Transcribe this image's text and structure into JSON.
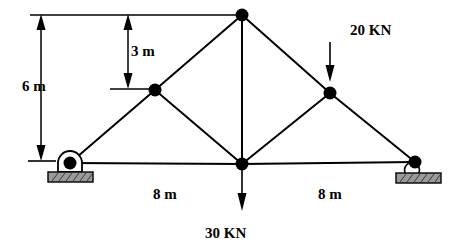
{
  "figure": {
    "type": "structural-truss-diagram",
    "colors": {
      "line": "#000000",
      "node": "#000000",
      "support_base_fill": "#9a9a9a",
      "support_base_stroke": "#000000",
      "background": "#ffffff"
    }
  },
  "dimensions": {
    "height_total": {
      "value": "6 m",
      "orientation": "vertical"
    },
    "height_upper": {
      "value": "3 m",
      "orientation": "vertical"
    },
    "span_left": {
      "value": "8 m",
      "orientation": "horizontal"
    },
    "span_right": {
      "value": "8 m",
      "orientation": "horizontal"
    }
  },
  "loads": [
    {
      "name": "load-20kn",
      "value": "20 KN",
      "direction": "down",
      "applied_at": "right-upper-node"
    },
    {
      "name": "load-30kn",
      "value": "30 KN",
      "direction": "down",
      "applied_at": "center-bottom-node"
    }
  ],
  "nodes": [
    {
      "name": "apex-node",
      "x": 242,
      "y": 15
    },
    {
      "name": "left-upper-node",
      "x": 155,
      "y": 90
    },
    {
      "name": "right-upper-node",
      "x": 330,
      "y": 93
    },
    {
      "name": "left-support-node",
      "x": 70,
      "y": 163
    },
    {
      "name": "center-bottom-node",
      "x": 242,
      "y": 164
    },
    {
      "name": "right-support-node",
      "x": 415,
      "y": 162
    }
  ],
  "members": [
    {
      "name": "member-bottom-chord-left",
      "from": "left-support-node",
      "to": "center-bottom-node"
    },
    {
      "name": "member-bottom-chord-right",
      "from": "center-bottom-node",
      "to": "right-support-node"
    },
    {
      "name": "member-rafter-left-lower",
      "from": "left-support-node",
      "to": "left-upper-node"
    },
    {
      "name": "member-rafter-left-upper",
      "from": "left-upper-node",
      "to": "apex-node"
    },
    {
      "name": "member-rafter-right-upper",
      "from": "apex-node",
      "to": "right-upper-node"
    },
    {
      "name": "member-rafter-right-lower",
      "from": "right-upper-node",
      "to": "right-support-node"
    },
    {
      "name": "member-center-vertical",
      "from": "apex-node",
      "to": "center-bottom-node"
    },
    {
      "name": "member-diagonal-left",
      "from": "left-upper-node",
      "to": "center-bottom-node"
    },
    {
      "name": "member-diagonal-right",
      "from": "center-bottom-node",
      "to": "right-upper-node"
    }
  ],
  "supports": [
    {
      "name": "pin-support-left",
      "type": "pin",
      "at": "left-support-node"
    },
    {
      "name": "roller-support-right",
      "type": "roller",
      "at": "right-support-node"
    }
  ]
}
